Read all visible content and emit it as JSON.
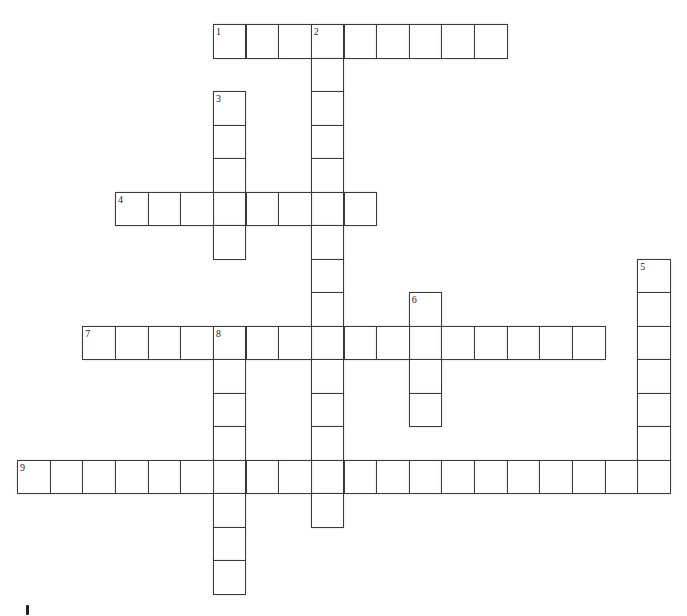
{
  "puzzle": {
    "type": "crossword",
    "grid": {
      "origin_x": 17,
      "origin_y": 24,
      "cell_w": 32.65,
      "cell_h": 33.5
    },
    "words": [
      {
        "number": "1",
        "direction": "across",
        "row": 0,
        "col": 6,
        "length": 9
      },
      {
        "number": "2",
        "direction": "down",
        "row": 0,
        "col": 9,
        "length": 15
      },
      {
        "number": "3",
        "direction": "down",
        "row": 2,
        "col": 6,
        "length": 5
      },
      {
        "number": "4",
        "direction": "across",
        "row": 5,
        "col": 3,
        "length": 8
      },
      {
        "number": "5",
        "direction": "down",
        "row": 7,
        "col": 19,
        "length": 7
      },
      {
        "number": "6",
        "direction": "down",
        "row": 8,
        "col": 12,
        "length": 4
      },
      {
        "number": "7",
        "direction": "across",
        "row": 9,
        "col": 2,
        "length": 16
      },
      {
        "number": "8",
        "direction": "down",
        "row": 9,
        "col": 6,
        "length": 8
      },
      {
        "number": "9",
        "direction": "across",
        "row": 13,
        "col": 0,
        "length": 20
      }
    ]
  },
  "colors": {
    "border": "#3a3a3a",
    "cell_bg": "#ffffff",
    "number": "#222222"
  }
}
